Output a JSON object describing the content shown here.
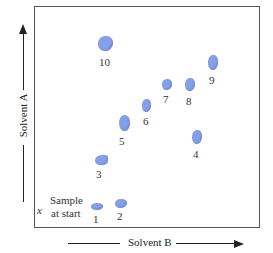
{
  "diagram": {
    "type": "2D thin-layer chromatography plate",
    "x_axis_label": "Solvent B",
    "y_axis_label": "Solvent A",
    "start_marker": "x",
    "start_label_line1": "Sample",
    "start_label_line2": "at start",
    "spot_color": "#86a0e6",
    "spots": [
      {
        "id": "1",
        "label": "1"
      },
      {
        "id": "2",
        "label": "2"
      },
      {
        "id": "3",
        "label": "3"
      },
      {
        "id": "4",
        "label": "4"
      },
      {
        "id": "5",
        "label": "5"
      },
      {
        "id": "6",
        "label": "6"
      },
      {
        "id": "7",
        "label": "7"
      },
      {
        "id": "8",
        "label": "8"
      },
      {
        "id": "9",
        "label": "9"
      },
      {
        "id": "10",
        "label": "10"
      }
    ]
  }
}
